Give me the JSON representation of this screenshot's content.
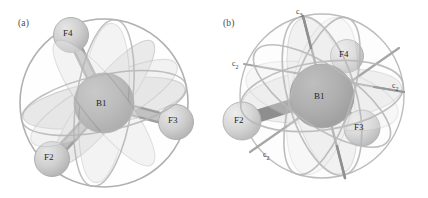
{
  "figure": {
    "background_color": "#ffffff",
    "ink_color": "#9d9d9d",
    "central_atom_color": "#9a9a9a",
    "ligand_atom_color": "#cfcfcf",
    "bond_color": "#a8a8a8",
    "lobe_color": "#d5d5d5",
    "sphere_outline_color": "#b3b3b3",
    "label_color": "#262626"
  },
  "panels": [
    {
      "id": "a",
      "tag": "(a)",
      "tag_position": {
        "x": 18,
        "y": 18
      },
      "description": "Tetrahedral BF4 unit with central boron and three visible fluorine atoms, surrounded by three intersecting mirror-plane lobes and an enclosing sphere",
      "atoms": [
        {
          "name": "B1",
          "label": "B1",
          "role": "central",
          "cx": 104,
          "cy": 103,
          "r": 30,
          "label_x": 96,
          "label_y": 98
        },
        {
          "name": "F4",
          "label": "F4",
          "role": "ligand",
          "cx": 71,
          "cy": 35,
          "r": 17,
          "label_x": 63,
          "label_y": 28
        },
        {
          "name": "F3",
          "label": "F3",
          "role": "ligand",
          "cx": 176,
          "cy": 122,
          "r": 17,
          "label_x": 168,
          "label_y": 115
        },
        {
          "name": "F2",
          "label": "F2",
          "role": "ligand",
          "cx": 52,
          "cy": 159,
          "r": 17,
          "label_x": 44,
          "label_y": 152
        }
      ],
      "bonds": [
        {
          "from": "B1",
          "to": "F4"
        },
        {
          "from": "B1",
          "to": "F3"
        },
        {
          "from": "B1",
          "to": "F2"
        }
      ],
      "axis_labels": []
    },
    {
      "id": "b",
      "tag": "(b)",
      "tag_position": {
        "x": 9,
        "y": 18
      },
      "description": "Same BF4 unit drawn with rotational symmetry axes: one C3 axis through the top vertex and several C2 axes",
      "atoms": [
        {
          "name": "B1",
          "label": "B1",
          "role": "central",
          "cx": 108,
          "cy": 96,
          "r": 32,
          "label_x": 100,
          "label_y": 91
        },
        {
          "name": "F4",
          "label": "F4",
          "role": "ligand",
          "cx": 133,
          "cy": 56,
          "r": 16,
          "label_x": 125,
          "label_y": 49
        },
        {
          "name": "F3",
          "label": "F3",
          "role": "ligand",
          "cx": 148,
          "cy": 128,
          "r": 18,
          "label_x": 140,
          "label_y": 122
        },
        {
          "name": "F2",
          "label": "F2",
          "role": "ligand",
          "cx": 28,
          "cy": 121,
          "r": 19,
          "label_x": 20,
          "label_y": 115
        }
      ],
      "bonds": [
        {
          "from": "B1",
          "to": "F4"
        },
        {
          "from": "B1",
          "to": "F3"
        },
        {
          "from": "B1",
          "to": "F2"
        }
      ],
      "axis_labels": [
        {
          "name": "c3-axis-label",
          "base": "c",
          "sub": "3",
          "x": 82,
          "y": 7
        },
        {
          "name": "c2-axis-label-upper-left",
          "base": "c",
          "sub": "2",
          "x": 18,
          "y": 59
        },
        {
          "name": "c2-axis-label-right",
          "base": "c",
          "sub": "2",
          "x": 178,
          "y": 81
        },
        {
          "name": "c2-axis-label-lower-left",
          "base": "c",
          "sub": "2",
          "x": 49,
          "y": 150
        }
      ]
    }
  ]
}
